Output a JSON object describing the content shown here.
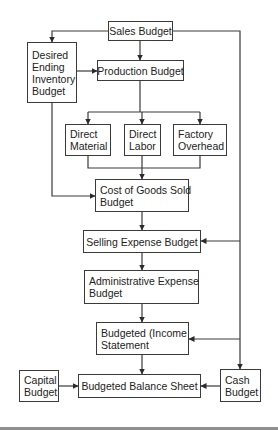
{
  "diagram": {
    "type": "flowchart",
    "nodes": {
      "sales": {
        "lines": [
          "Sales Budget"
        ]
      },
      "inventory": {
        "lines": [
          "Desired",
          "Ending",
          "Inventory",
          "Budget"
        ]
      },
      "production": {
        "lines": [
          "Production Budget"
        ]
      },
      "material": {
        "lines": [
          "Direct",
          "Material"
        ]
      },
      "labor": {
        "lines": [
          "Direct",
          "Labor"
        ]
      },
      "overhead": {
        "lines": [
          "Factory",
          "Overhead"
        ]
      },
      "cogs": {
        "lines": [
          "Cost of Goods Sold",
          "Budget"
        ]
      },
      "selling": {
        "lines": [
          "Selling Expense Budget"
        ]
      },
      "admin": {
        "lines": [
          "Administrative Expense",
          "Budget"
        ]
      },
      "income": {
        "lines": [
          "Budgeted (Income",
          "Statement"
        ]
      },
      "capital": {
        "lines": [
          "Capital",
          "Budget"
        ]
      },
      "balance": {
        "lines": [
          "Budgeted Balance Sheet"
        ]
      },
      "cash": {
        "lines": [
          "Cash",
          "Budget"
        ]
      }
    },
    "edges": [
      [
        "sales",
        "inventory"
      ],
      [
        "sales",
        "production"
      ],
      [
        "sales",
        "cash"
      ],
      [
        "inventory",
        "production"
      ],
      [
        "inventory",
        "cogs"
      ],
      [
        "production",
        "material"
      ],
      [
        "production",
        "labor"
      ],
      [
        "production",
        "overhead"
      ],
      [
        "material",
        "cogs"
      ],
      [
        "labor",
        "cogs"
      ],
      [
        "overhead",
        "cogs"
      ],
      [
        "cogs",
        "selling"
      ],
      [
        "cash",
        "selling"
      ],
      [
        "selling",
        "admin"
      ],
      [
        "admin",
        "income"
      ],
      [
        "cash",
        "income"
      ],
      [
        "income",
        "balance"
      ],
      [
        "capital",
        "balance"
      ],
      [
        "cash",
        "balance"
      ]
    ],
    "colors": {
      "line": "#3a3a3a",
      "rule": "#8f8f8f"
    }
  }
}
